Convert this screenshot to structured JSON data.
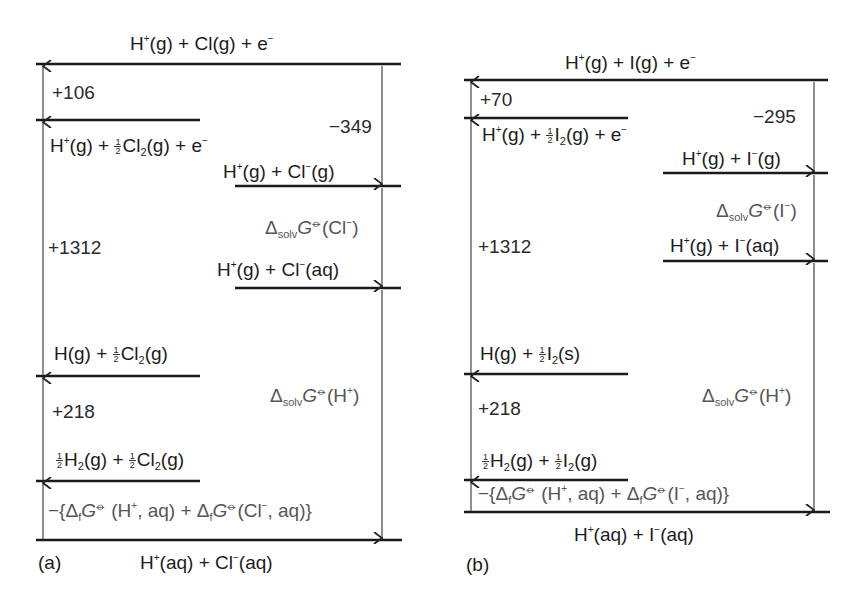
{
  "figure": {
    "type": "Born-Haber style thermodynamic cycle diagrams",
    "units_implied": "kJ mol-1",
    "colors": {
      "level_line": "#1a1a1a",
      "arrow": "#444444",
      "text": "#1c1c1c",
      "secondary_text": "#555555"
    }
  },
  "panel_a": {
    "tag": "(a)",
    "levels": {
      "top": {
        "species": [
          "H",
          "+",
          "(g) + Cl(g) + e",
          "−"
        ]
      },
      "l2": {
        "p1": "H",
        "p1sup": "+",
        "p2": "(g) + ",
        "frac_num": "1",
        "frac_den": "2",
        "p3": "Cl",
        "p3sub": "2",
        "p4": "(g) + e",
        "p4sup": "−"
      },
      "l3": {
        "p1": "H",
        "p1sup": "+",
        "p2": "(g) + Cl",
        "p2sup": "−",
        "p3": "(g)"
      },
      "l4": {
        "p1": "H",
        "p1sup": "+",
        "p2": "(g) + Cl",
        "p2sup": "−",
        "p3": "(aq)"
      },
      "l5": {
        "p1": "H(g) + ",
        "frac_num": "1",
        "frac_den": "2",
        "p2": "Cl",
        "p2sub": "2",
        "p3": "(g)"
      },
      "l6": {
        "frac_num": "1",
        "frac_den": "2",
        "p1": "H",
        "p1sub": "2",
        "p2": "(g) + ",
        "p3": "Cl",
        "p3sub": "2",
        "p4": "(g)"
      },
      "bottom": {
        "p1": "H",
        "p1sup": "+",
        "p2": "(aq) + Cl",
        "p2sup": "−",
        "p3": "(aq)"
      }
    },
    "values": {
      "v106": "+106",
      "v349": "−349",
      "v1312": "+1312",
      "v218": "+218"
    },
    "solv_anion": {
      "delta": "Δ",
      "sub": "solv",
      "G": "G",
      "plim": "⦵",
      "arg": "(Cl",
      "argsup": "−",
      "close": ")"
    },
    "solv_cation": {
      "delta": "Δ",
      "sub": "solv",
      "G": "G",
      "plim": "⦵",
      "arg": "(H",
      "argsup": "+",
      "close": ")"
    },
    "formation": {
      "p1": "−{Δ",
      "p1sub": "f",
      "G": "G",
      "plim": "⦵",
      "p2": " (H",
      "p2sup": "+",
      "p3": ", aq) + Δ",
      "p3sub": "f",
      "G2": "G",
      "plim2": "⦵",
      "p4": "(Cl",
      "p4sup": "−",
      "p5": ", aq)}"
    }
  },
  "panel_b": {
    "tag": "(b)",
    "levels": {
      "top": {
        "p1": "H",
        "p1sup": "+",
        "p2": "(g) + I(g) + e",
        "p2sup": "−"
      },
      "l2": {
        "p1": "H",
        "p1sup": "+",
        "p2": "(g) + ",
        "frac_num": "1",
        "frac_den": "2",
        "p3": "I",
        "p3sub": "2",
        "p4": "(g) + e",
        "p4sup": "−"
      },
      "l3": {
        "p1": "H",
        "p1sup": "+",
        "p2": "(g) + I",
        "p2sup": "−",
        "p3": "(g)"
      },
      "l4": {
        "p1": "H",
        "p1sup": "+",
        "p2": "(g) + I",
        "p2sup": "−",
        "p3": "(aq)"
      },
      "l5": {
        "p1": "H(g) + ",
        "frac_num": "1",
        "frac_den": "2",
        "p2": "I",
        "p2sub": "2",
        "p3": "(s)"
      },
      "l6": {
        "frac_num": "1",
        "frac_den": "2",
        "p1": "H",
        "p1sub": "2",
        "p2": "(g) + ",
        "p3": "I",
        "p3sub": "2",
        "p4": "(g)"
      },
      "bottom": {
        "p1": "H",
        "p1sup": "+",
        "p2": "(aq) + I",
        "p2sup": "−",
        "p3": "(aq)"
      }
    },
    "values": {
      "v70": "+70",
      "v295": "−295",
      "v1312": "+1312",
      "v218": "+218"
    },
    "solv_anion": {
      "delta": "Δ",
      "sub": "solv",
      "G": "G",
      "plim": "⦵",
      "arg": "(I",
      "argsup": "−",
      "close": ")"
    },
    "solv_cation": {
      "delta": "Δ",
      "sub": "solv",
      "G": "G",
      "plim": "⦵",
      "arg": "(H",
      "argsup": "+",
      "close": ")"
    },
    "formation": {
      "p1": "−{Δ",
      "p1sub": "f",
      "G": "G",
      "plim": "⦵",
      "p2": " (H",
      "p2sup": "+",
      "p3": ", aq) + Δ",
      "p3sub": "f",
      "G2": "G",
      "plim2": "⦵",
      "p4": "(I",
      "p4sup": "−",
      "p5": ", aq)}"
    }
  }
}
